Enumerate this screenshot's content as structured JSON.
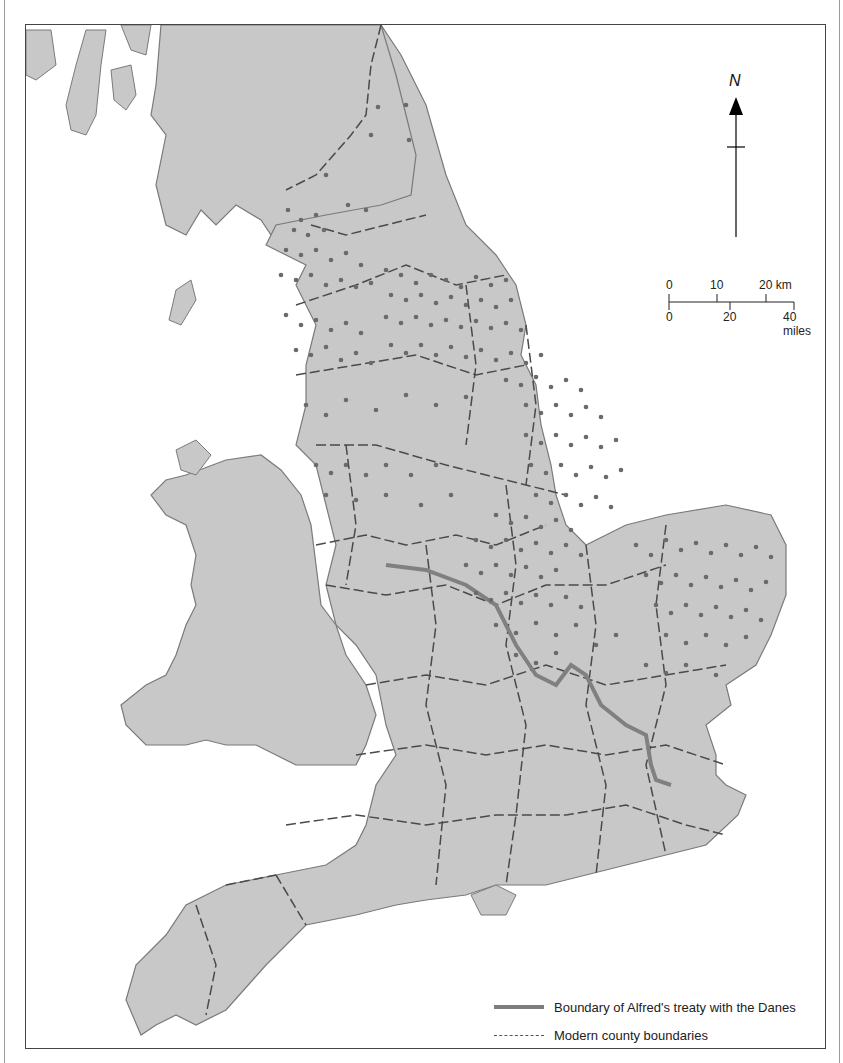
{
  "map": {
    "title_visible": "",
    "colors": {
      "land": "#c8c8c8",
      "coast": "#7a7a7a",
      "sea": "#ffffff",
      "dots": "#6a6a6a",
      "treaty_line": "#808080",
      "county_line": "#4a4a4a"
    }
  },
  "north_arrow": {
    "label": "N"
  },
  "scale_bar": {
    "km_ticks": [
      "0",
      "10",
      "20 km"
    ],
    "mile_ticks": [
      "0",
      "20",
      "40 miles"
    ]
  },
  "legend": {
    "items": [
      {
        "label": "Boundary of Alfred's treaty with the Danes",
        "symbol": "thick-grey-line"
      },
      {
        "label": "Modern county boundaries",
        "symbol": "dashed-line"
      }
    ]
  }
}
